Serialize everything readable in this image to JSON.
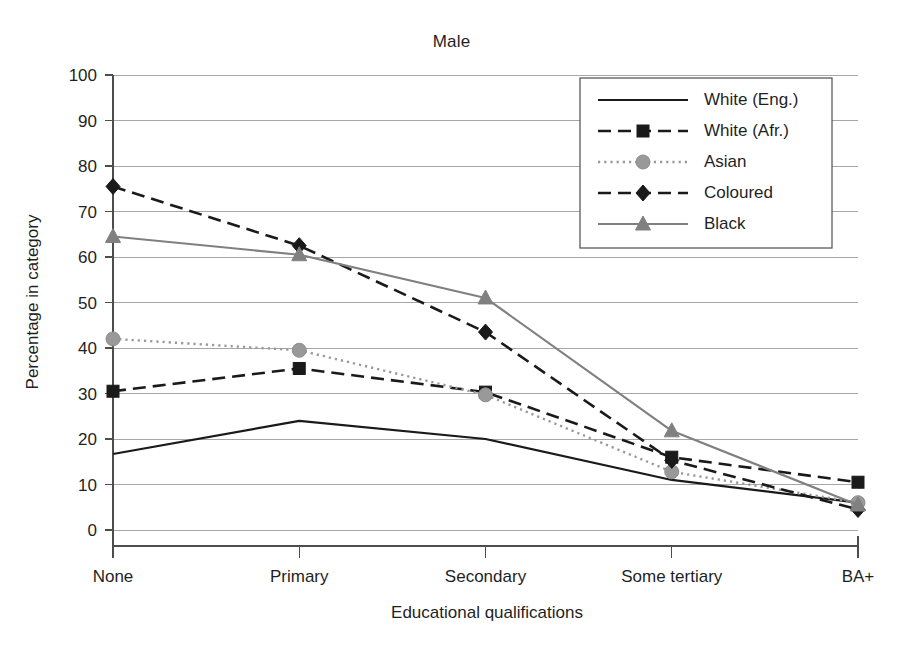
{
  "chart_data": {
    "type": "line",
    "title": "Male",
    "xlabel": "Educational qualifications",
    "ylabel": "Percentage in category",
    "categories": [
      "None",
      "Primary",
      "Secondary",
      "Some tertiary",
      "BA+"
    ],
    "ylim": [
      0,
      100
    ],
    "yticks": [
      0,
      10,
      20,
      30,
      40,
      50,
      60,
      70,
      80,
      90,
      100
    ],
    "grid": true,
    "legend_position": "top-right",
    "series": [
      {
        "name": "White (Eng.)",
        "values": [
          16.7,
          24.0,
          20.0,
          11.0,
          6.0
        ],
        "color": "#1a1a1a",
        "marker": "none",
        "dash": "solid"
      },
      {
        "name": "White (Afr.)",
        "values": [
          30.5,
          35.5,
          30.3,
          16.0,
          10.5
        ],
        "color": "#1a1a1a",
        "marker": "square",
        "dash": "dashed"
      },
      {
        "name": "Asian",
        "values": [
          42.0,
          39.5,
          29.7,
          12.8,
          6.0
        ],
        "color": "#999999",
        "marker": "circle",
        "dash": "dotted"
      },
      {
        "name": "Coloured",
        "values": [
          75.5,
          62.5,
          43.5,
          15.3,
          4.5
        ],
        "color": "#1a1a1a",
        "marker": "diamond",
        "dash": "dashed"
      },
      {
        "name": "Black",
        "values": [
          64.5,
          60.5,
          51.0,
          21.8,
          5.5
        ],
        "color": "#808080",
        "marker": "triangle",
        "dash": "solid"
      }
    ]
  }
}
